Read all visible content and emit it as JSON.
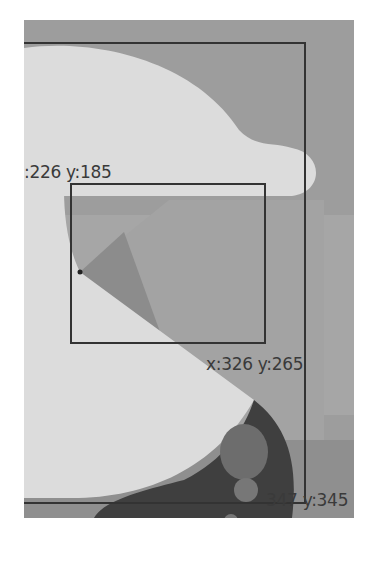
{
  "canvas": {
    "colors": {
      "background": "#9d9d9d",
      "cloud": "#dcdcdc",
      "beam_dark": "#8c8c8c",
      "beam_light": "#a2a2a2",
      "planet": "#3f3f3f",
      "planet_spots": "#777777",
      "box_stroke": "#333333"
    }
  },
  "outer_box": {
    "top_left_label": "x:226 y:185",
    "bottom_right_label": "x:347 y:345"
  },
  "inner_box": {
    "top_left_label": "x:226 y:185",
    "bottom_right_label": "x:326 y:265"
  },
  "labels": {
    "top_left_visible": ":226 y:185",
    "inner_bottom_right": "x:326 y:265",
    "outer_bottom_right_visible": "347 y:345"
  },
  "origin_point": {
    "name": "beam-origin-dot"
  }
}
